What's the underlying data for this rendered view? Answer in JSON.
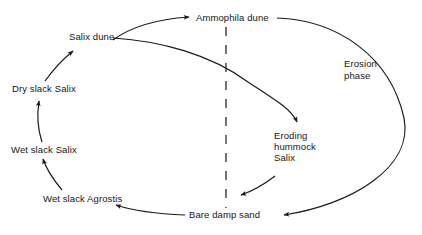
{
  "diagram": {
    "background_color": "#ffffff",
    "line_color": "#1a1a1a",
    "text_color": "#161616",
    "nodes": {
      "ammophila_dune": "Ammophila dune",
      "salix_dune": "Salix dune",
      "dry_slack_salix": "Dry slack Salix",
      "wet_slack_salix": "Wet slack Salix",
      "wet_slack_agrostis": "Wet slack Agrostis",
      "bare_damp_sand": "Bare damp sand",
      "eroding_hummock_salix_line1": "Eroding",
      "eroding_hummock_salix_line2": "hummock",
      "eroding_hummock_salix_line3": "Salix"
    },
    "annotations": {
      "erosion_phase_line1": "Erosion",
      "erosion_phase_line2": "phase"
    },
    "divider": {
      "style": "dashed",
      "orientation": "vertical"
    }
  }
}
